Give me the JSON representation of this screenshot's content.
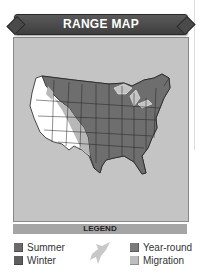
{
  "header": {
    "title": "RANGE MAP"
  },
  "map": {
    "background": "#c4c4c4"
  },
  "legend": {
    "title": "LEGEND",
    "items": [
      {
        "label": "Summer",
        "color": "#6a6a6a"
      },
      {
        "label": "Winter",
        "color": "#5e5e5e"
      },
      {
        "label": "Year-round",
        "color": "#7a7a7a"
      },
      {
        "label": "Migration",
        "color": "#bdbdbd"
      }
    ],
    "icon": "bird-silhouette-icon"
  }
}
